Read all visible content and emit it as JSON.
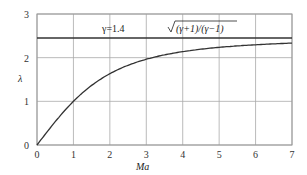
{
  "chart_data": {
    "type": "line",
    "title": "",
    "xlabel": "Ma",
    "ylabel": "λ",
    "xlim": [
      0,
      7
    ],
    "ylim": [
      0,
      3
    ],
    "xticks": [
      "0",
      "1",
      "2",
      "3",
      "4",
      "5",
      "6",
      "7"
    ],
    "yticks": [
      "0",
      "1",
      "2",
      "3"
    ],
    "grid": true,
    "annotations": [
      {
        "text": "γ=1.4",
        "x": 1.5,
        "y": 2.6
      },
      {
        "text": "√((γ+1)/(γ−1))",
        "x": 3.8,
        "y": 2.6
      }
    ],
    "series": [
      {
        "name": "λ(Ma), γ=1.4",
        "x": [
          0,
          0.5,
          1,
          1.5,
          2,
          2.5,
          3,
          3.5,
          4,
          5,
          6,
          7
        ],
        "values": [
          0,
          0.54,
          1.0,
          1.36,
          1.63,
          1.83,
          1.96,
          2.06,
          2.14,
          2.24,
          2.3,
          2.33
        ]
      },
      {
        "name": "asymptote √((γ+1)/(γ−1))",
        "x": [
          0,
          7
        ],
        "values": [
          2.449,
          2.449
        ]
      }
    ]
  },
  "labels": {
    "x_axis": "Ma",
    "y_axis": "λ",
    "gamma": "γ=1.4",
    "asymptote": "(γ+1)/(γ−1)"
  }
}
